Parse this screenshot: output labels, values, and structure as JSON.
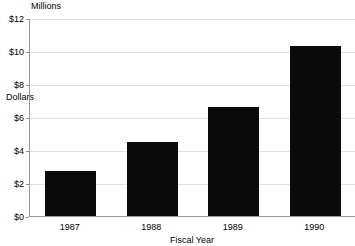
{
  "chart_data": {
    "type": "bar",
    "title": "",
    "subtitle": "",
    "unit_caption": "Millions",
    "xlabel": "Fiscal Year",
    "ylabel": "Dollars",
    "categories": [
      "1987",
      "1988",
      "1989",
      "1990"
    ],
    "values": [
      2.7,
      4.5,
      6.6,
      10.3
    ],
    "series": [
      {
        "name": "Dollars",
        "values": [
          2.7,
          4.5,
          6.6,
          10.3
        ],
        "color": "#0b0b0b"
      }
    ],
    "ylim": [
      0,
      12
    ],
    "ytick_values": [
      0,
      2,
      4,
      6,
      8,
      10,
      12
    ],
    "ytick_labels": [
      "$0",
      "$2",
      "$4",
      "$6",
      "$8",
      "$10",
      "$12"
    ],
    "grid": true,
    "grid_axis": "y",
    "legend": false,
    "legend_position": "none",
    "bar_color": "#0b0b0b",
    "axis_color": "#9a9a9a",
    "gridline_color": "#e3e3e3",
    "background": "#ffffff"
  }
}
